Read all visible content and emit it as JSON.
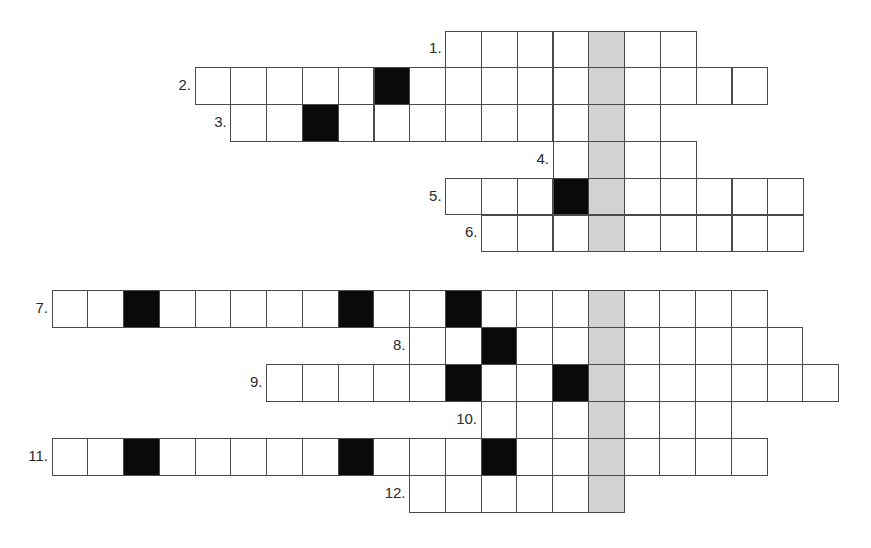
{
  "colors": {
    "cell_fill": "#ffffff",
    "block_fill": "#0a0a0a",
    "highlight_column_fill": "#d3d3d3",
    "grid_line": "#4a4a4a",
    "label_text": "#2a2a2a"
  },
  "puzzles": [
    {
      "name": "crossword-top",
      "origin_x": 195,
      "origin_y": 31,
      "cell_width": 35.8,
      "cell_height": 36.8,
      "highlight_column": 11,
      "rows": [
        {
          "label": "1.",
          "start": 7,
          "length": 7,
          "blocks": []
        },
        {
          "label": "2.",
          "start": 0,
          "length": 16,
          "blocks": [
            5
          ]
        },
        {
          "label": "3.",
          "start": 1,
          "length": 12,
          "blocks": [
            3
          ]
        },
        {
          "label": "4.",
          "start": 10,
          "length": 4,
          "blocks": []
        },
        {
          "label": "5.",
          "start": 7,
          "length": 10,
          "blocks": [
            10
          ]
        },
        {
          "label": "6.",
          "start": 8,
          "length": 9,
          "blocks": []
        }
      ]
    },
    {
      "name": "crossword-bottom",
      "origin_x": 52,
      "origin_y": 290,
      "cell_width": 35.75,
      "cell_height": 37,
      "highlight_column": 15,
      "rows": [
        {
          "label": "7.",
          "start": 0,
          "length": 20,
          "blocks": [
            2,
            8,
            11
          ]
        },
        {
          "label": "8.",
          "start": 10,
          "length": 11,
          "blocks": [
            12
          ]
        },
        {
          "label": "9.",
          "start": 6,
          "length": 16,
          "blocks": [
            11,
            14
          ]
        },
        {
          "label": "10.",
          "start": 12,
          "length": 7,
          "blocks": []
        },
        {
          "label": "11.",
          "start": 0,
          "length": 20,
          "blocks": [
            2,
            8,
            12
          ]
        },
        {
          "label": "12.",
          "start": 10,
          "length": 6,
          "blocks": []
        }
      ]
    }
  ]
}
